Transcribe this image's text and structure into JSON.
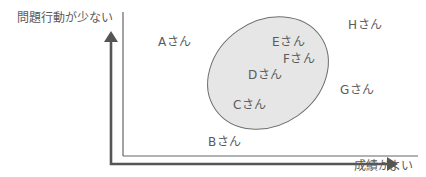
{
  "diagram": {
    "y_axis_label": "問題行動が少ない",
    "x_axis_label": "成績がよい",
    "group_fill_color": "#e6e6e6",
    "group_stroke_color": "#6e6e6e",
    "axis_color": "#555555",
    "frame_color": "#666666",
    "students": [
      {
        "id": "A",
        "label": "Aさん",
        "in_group": false
      },
      {
        "id": "B",
        "label": "Bさん",
        "in_group": false
      },
      {
        "id": "C",
        "label": "Cさん",
        "in_group": true
      },
      {
        "id": "D",
        "label": "Dさん",
        "in_group": true
      },
      {
        "id": "E",
        "label": "Eさん",
        "in_group": true
      },
      {
        "id": "F",
        "label": "Fさん",
        "in_group": true
      },
      {
        "id": "G",
        "label": "Gさん",
        "in_group": false
      },
      {
        "id": "H",
        "label": "Hさん",
        "in_group": false
      }
    ]
  }
}
